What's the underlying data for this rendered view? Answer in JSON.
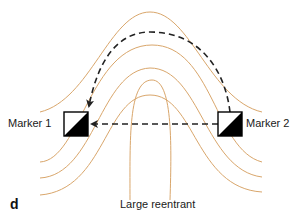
{
  "panel_letter": "d",
  "caption": "Large reentrant",
  "markers": [
    {
      "label": "Marker 1",
      "x": 64,
      "y": 112,
      "size": 24
    },
    {
      "label": "Marker 2",
      "x": 218,
      "y": 112,
      "size": 24
    }
  ],
  "colors": {
    "contour": "#d9a66b",
    "arrow": "#222222",
    "marker_fill": "#000000",
    "background": "#ffffff"
  },
  "contours": [
    "M 40 112 C 90 100, 110 12, 150 12 C 190 12, 210 100, 262 112",
    "M 40 162 C 80 160, 90 45, 152 45 C 212 45, 215 150, 262 162",
    "M 40 178 C 95 175, 100 70, 150 68 C 200 68, 205 170, 262 177",
    "M 40 195 C 105 190, 105 95, 150 95 C 195 95, 195 188, 262 192",
    "M 130 200 C 130 140, 128 80, 152 80 C 172 80, 172 140, 170 200"
  ],
  "arrows": [
    {
      "id": "curved-path",
      "d": "M 230 112 C 225 70, 200 32, 150 32 C 110 32, 95 75, 89 106"
    },
    {
      "id": "straight-path",
      "d": "M 218 124 L 92 124"
    }
  ]
}
